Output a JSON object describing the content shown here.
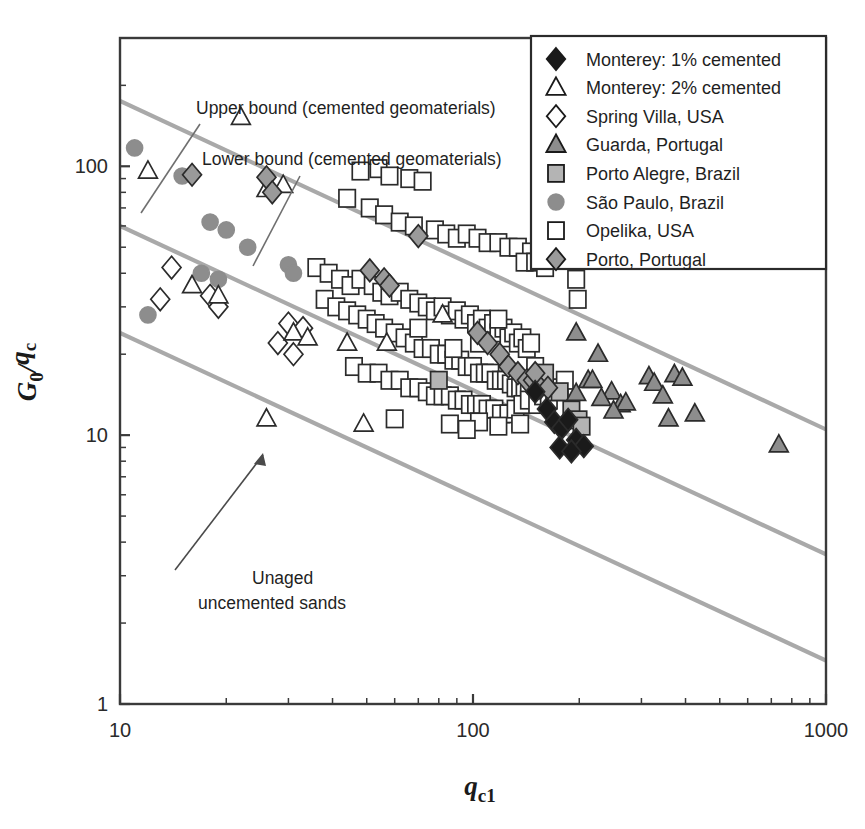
{
  "figure": {
    "background": "#ffffff",
    "frame_color": "#3a3a3a",
    "trend_line_color": "#a9a9a9",
    "marker_fill_gray": "#8d8d8d",
    "marker_fill_lightgray": "#c2c2c2",
    "marker_fill_black": "#1a1a1a",
    "marker_fill_white": "#ffffff"
  },
  "axes": {
    "x": {
      "label_main": "q",
      "label_sub": "c1",
      "scale": "log",
      "min": 10,
      "max": 1000,
      "tick_labels": [
        "10",
        "100",
        "1000"
      ],
      "tick_values": [
        10,
        100,
        1000
      ]
    },
    "y": {
      "label_main": "G",
      "label_main_sub": "0",
      "label_slash": "/",
      "label_den": "q",
      "label_den_sub": "c",
      "scale": "log",
      "min": 1,
      "max": 300,
      "tick_labels": [
        "1",
        "10",
        "100"
      ],
      "tick_values": [
        1,
        10,
        100
      ]
    }
  },
  "annotations": [
    {
      "id": "upper-bound",
      "text": "Upper bound (cemented geomaterials)",
      "x": 196,
      "y": 114
    },
    {
      "id": "lower-bound",
      "text": "Lower bound (cemented geomaterials)",
      "x": 202,
      "y": 165
    },
    {
      "id": "unaged-line1",
      "text": "Unaged",
      "x": 252,
      "y": 584
    },
    {
      "id": "unaged-line2",
      "text": "uncemented sands",
      "x": 198,
      "y": 609
    }
  ],
  "legend": {
    "box": {
      "x": 531,
      "y": 36,
      "width": 295,
      "height": 233
    },
    "items": [
      {
        "label": "Monterey: 1% cemented",
        "marker": "diamond",
        "fill": "#1a1a1a",
        "stroke": "#1a1a1a"
      },
      {
        "label": "Monterey: 2% cemented",
        "marker": "triangle",
        "fill": "#ffffff",
        "stroke": "#1a1a1a"
      },
      {
        "label": "Spring Villa, USA",
        "marker": "diamond",
        "fill": "#ffffff",
        "stroke": "#1a1a1a"
      },
      {
        "label": "Guarda, Portugal",
        "marker": "triangle",
        "fill": "#8d8d8d",
        "stroke": "#1a1a1a"
      },
      {
        "label": "Porto Alegre, Brazil",
        "marker": "square",
        "fill": "#b4b4b4",
        "stroke": "#1a1a1a"
      },
      {
        "label": "São Paulo, Brazil",
        "marker": "circle",
        "fill": "#8d8d8d",
        "stroke": "#8d8d8d"
      },
      {
        "label": "Opelika, USA",
        "marker": "square",
        "fill": "#ffffff",
        "stroke": "#1a1a1a"
      },
      {
        "label": "Porto, Portugal",
        "marker": "diamond",
        "fill": "#9a9a9a",
        "stroke": "#1a1a1a"
      }
    ]
  },
  "chart_data": {
    "type": "scatter",
    "title": "",
    "xlabel": "q_c1",
    "ylabel": "G_0/q_c",
    "xscale": "log",
    "yscale": "log",
    "xlim": [
      10,
      1000
    ],
    "ylim": [
      1,
      300
    ],
    "grid": false,
    "legend_position": "top-right",
    "trend_lines": [
      {
        "name": "Upper bound (cemented geomaterials)",
        "x": [
          10,
          1000
        ],
        "y": [
          175,
          10.5
        ],
        "color": "#a9a9a9"
      },
      {
        "name": "Lower bound (cemented geomaterials)",
        "x": [
          10,
          1000
        ],
        "y": [
          60,
          3.6
        ],
        "color": "#a9a9a9"
      },
      {
        "name": "Unaged uncemented sands",
        "x": [
          10,
          1000
        ],
        "y": [
          24,
          1.45
        ],
        "color": "#a9a9a9"
      }
    ],
    "series": [
      {
        "name": "Monterey: 1% cemented",
        "marker": "diamond",
        "fill": "#1a1a1a",
        "points": [
          [
            150,
            14.5
          ],
          [
            162,
            12.5
          ],
          [
            170,
            11.2
          ],
          [
            178,
            10.6
          ],
          [
            186,
            11.4
          ],
          [
            196,
            9.6
          ],
          [
            206,
            9.1
          ],
          [
            176,
            9.0
          ],
          [
            190,
            8.7
          ]
        ]
      },
      {
        "name": "Monterey: 2% cemented",
        "marker": "triangle",
        "fill": "#ffffff",
        "points": [
          [
            22,
            152
          ],
          [
            12,
            96
          ],
          [
            26,
            82
          ],
          [
            29,
            85
          ],
          [
            16,
            36
          ],
          [
            19,
            33
          ],
          [
            31,
            24
          ],
          [
            34,
            23
          ],
          [
            44,
            22
          ],
          [
            26,
            11.5
          ],
          [
            49,
            11.0
          ],
          [
            57,
            22
          ],
          [
            82,
            28
          ]
        ]
      },
      {
        "name": "Spring Villa, USA",
        "marker": "diamond",
        "fill": "#ffffff",
        "points": [
          [
            14,
            42
          ],
          [
            13,
            32
          ],
          [
            18,
            33
          ],
          [
            19,
            30
          ],
          [
            30,
            26
          ],
          [
            33,
            25
          ],
          [
            28,
            22
          ],
          [
            31,
            20
          ]
        ]
      },
      {
        "name": "Guarda, Portugal",
        "marker": "triangle",
        "fill": "#8d8d8d",
        "points": [
          [
            196,
            24
          ],
          [
            226,
            20
          ],
          [
            212,
            16
          ],
          [
            218,
            16
          ],
          [
            247,
            14.5
          ],
          [
            262,
            13.0
          ],
          [
            271,
            13.2
          ],
          [
            250,
            12.3
          ],
          [
            315,
            16.5
          ],
          [
            326,
            15.6
          ],
          [
            345,
            14.0
          ],
          [
            372,
            16.8
          ],
          [
            392,
            16.3
          ],
          [
            358,
            11.5
          ],
          [
            425,
            12.0
          ],
          [
            735,
            9.2
          ],
          [
            196,
            14.3
          ],
          [
            231,
            13.7
          ]
        ]
      },
      {
        "name": "Porto Alegre, Brazil",
        "marker": "square",
        "fill": "#b4b4b4",
        "points": [
          [
            160,
            17.0
          ],
          [
            176,
            14.5
          ],
          [
            190,
            12.4
          ],
          [
            199,
            11.4
          ],
          [
            203,
            10.8
          ],
          [
            80,
            16.0
          ]
        ]
      },
      {
        "name": "São Paulo, Brazil",
        "marker": "circle",
        "fill": "#8d8d8d",
        "points": [
          [
            11,
            117
          ],
          [
            15,
            92
          ],
          [
            18,
            62
          ],
          [
            20,
            58
          ],
          [
            23,
            50
          ],
          [
            17,
            40
          ],
          [
            19,
            38
          ],
          [
            30,
            43
          ],
          [
            31,
            40
          ],
          [
            12,
            28
          ]
        ]
      },
      {
        "name": "Opelika, USA",
        "marker": "square",
        "fill": "#ffffff",
        "points": [
          [
            48,
            96
          ],
          [
            54,
            98
          ],
          [
            58,
            92
          ],
          [
            66,
            90
          ],
          [
            72,
            88
          ],
          [
            44,
            76
          ],
          [
            51,
            70
          ],
          [
            56,
            66
          ],
          [
            62,
            62
          ],
          [
            68,
            60
          ],
          [
            78,
            58
          ],
          [
            84,
            56
          ],
          [
            90,
            54
          ],
          [
            96,
            56
          ],
          [
            103,
            54
          ],
          [
            110,
            52
          ],
          [
            118,
            52
          ],
          [
            126,
            50
          ],
          [
            134,
            50
          ],
          [
            146,
            48
          ],
          [
            158,
            50
          ],
          [
            168,
            48
          ],
          [
            190,
            52
          ],
          [
            206,
            50
          ],
          [
            252,
            56
          ],
          [
            196,
            38
          ],
          [
            198,
            32
          ],
          [
            140,
            44
          ],
          [
            150,
            44
          ],
          [
            160,
            42
          ],
          [
            36,
            42
          ],
          [
            39,
            40
          ],
          [
            42,
            38
          ],
          [
            45,
            36
          ],
          [
            48,
            38
          ],
          [
            52,
            36
          ],
          [
            55,
            34
          ],
          [
            58,
            33
          ],
          [
            62,
            34
          ],
          [
            66,
            32
          ],
          [
            70,
            31
          ],
          [
            74,
            30
          ],
          [
            78,
            29
          ],
          [
            82,
            30
          ],
          [
            86,
            28
          ],
          [
            90,
            29
          ],
          [
            94,
            27
          ],
          [
            98,
            28
          ],
          [
            102,
            26
          ],
          [
            106,
            27
          ],
          [
            110,
            25
          ],
          [
            114,
            26
          ],
          [
            118,
            24
          ],
          [
            122,
            25
          ],
          [
            126,
            23
          ],
          [
            130,
            24
          ],
          [
            134,
            22
          ],
          [
            138,
            23
          ],
          [
            142,
            21
          ],
          [
            146,
            22
          ],
          [
            38,
            32
          ],
          [
            41,
            30
          ],
          [
            44,
            29
          ],
          [
            47,
            28
          ],
          [
            50,
            27
          ],
          [
            53,
            26
          ],
          [
            56,
            25
          ],
          [
            60,
            24
          ],
          [
            64,
            23
          ],
          [
            68,
            22
          ],
          [
            72,
            21
          ],
          [
            76,
            21
          ],
          [
            80,
            20
          ],
          [
            84,
            20
          ],
          [
            88,
            19
          ],
          [
            92,
            19
          ],
          [
            96,
            18
          ],
          [
            100,
            18
          ],
          [
            104,
            17
          ],
          [
            108,
            17
          ],
          [
            112,
            17
          ],
          [
            116,
            16
          ],
          [
            120,
            16
          ],
          [
            124,
            16
          ],
          [
            128,
            15.5
          ],
          [
            132,
            15
          ],
          [
            136,
            15
          ],
          [
            140,
            15
          ],
          [
            144,
            14.5
          ],
          [
            150,
            14.5
          ],
          [
            46,
            18
          ],
          [
            50,
            17
          ],
          [
            54,
            17
          ],
          [
            58,
            16
          ],
          [
            62,
            16
          ],
          [
            66,
            15
          ],
          [
            70,
            15
          ],
          [
            74,
            14.5
          ],
          [
            78,
            14
          ],
          [
            82,
            14
          ],
          [
            86,
            14
          ],
          [
            90,
            13.5
          ],
          [
            94,
            13.5
          ],
          [
            98,
            13
          ],
          [
            102,
            13
          ],
          [
            106,
            13
          ],
          [
            110,
            12.5
          ],
          [
            115,
            12.5
          ],
          [
            120,
            12
          ],
          [
            126,
            12
          ],
          [
            132,
            12.5
          ],
          [
            138,
            13
          ],
          [
            144,
            13.5
          ],
          [
            152,
            13
          ],
          [
            158,
            14
          ],
          [
            164,
            13.5
          ],
          [
            170,
            14.5
          ],
          [
            176,
            15
          ],
          [
            182,
            16
          ],
          [
            150,
            18
          ],
          [
            60,
            11.5
          ],
          [
            86,
            11.0
          ],
          [
            104,
            11.2
          ],
          [
            118,
            10.8
          ],
          [
            96,
            10.5
          ],
          [
            136,
            11.0
          ],
          [
            88,
            21
          ],
          [
            104,
            22
          ],
          [
            70,
            25
          ],
          [
            118,
            27
          ]
        ]
      },
      {
        "name": "Porto, Portugal",
        "marker": "diamond",
        "fill": "#9a9a9a",
        "points": [
          [
            16,
            93
          ],
          [
            26,
            91
          ],
          [
            27,
            80
          ],
          [
            70,
            55
          ],
          [
            51,
            41
          ],
          [
            56,
            38
          ],
          [
            58,
            36
          ],
          [
            103,
            24
          ],
          [
            110,
            22
          ],
          [
            119,
            20
          ],
          [
            126,
            18
          ],
          [
            134,
            17
          ],
          [
            142,
            16
          ],
          [
            148,
            16
          ],
          [
            155,
            15
          ],
          [
            163,
            15
          ],
          [
            150,
            17
          ]
        ]
      }
    ]
  }
}
